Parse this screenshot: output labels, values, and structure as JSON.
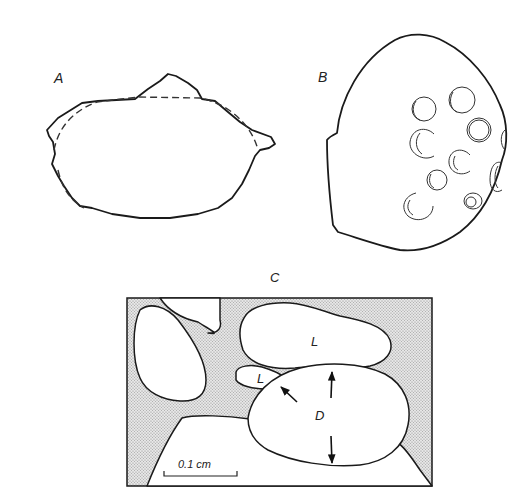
{
  "figure": {
    "panels": [
      {
        "id": "A",
        "label": "A",
        "description": "Irregular grain outline with dashed idealized ellipse fit"
      },
      {
        "id": "B",
        "label": "B",
        "description": "Rounded grain with surface pits/pores"
      },
      {
        "id": "C",
        "label": "C",
        "description": "Thin section of packed grains in stippled matrix"
      }
    ],
    "panel_c": {
      "grain_labels": {
        "long_axis_upper": "L",
        "long_axis_small": "L",
        "diameter": "D"
      },
      "scale_bar": {
        "label": "0.1 cm"
      }
    },
    "colors": {
      "ink": "#1a1a1a",
      "background": "#ffffff",
      "matrix_stipple": "#bdbdbd"
    }
  }
}
